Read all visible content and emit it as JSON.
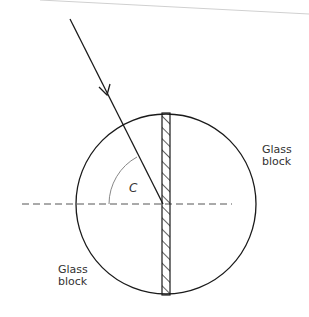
{
  "diagram": {
    "labels": {
      "glass_block_right_line1": "Glass",
      "glass_block_right_line2": "block",
      "glass_block_left_line1": "Glass",
      "glass_block_left_line2": "block",
      "angle": "C"
    },
    "colors": {
      "line": "#1a1a1a",
      "dashed": "#555555",
      "arc": "#888888",
      "top_edge": "#cccccc"
    }
  }
}
